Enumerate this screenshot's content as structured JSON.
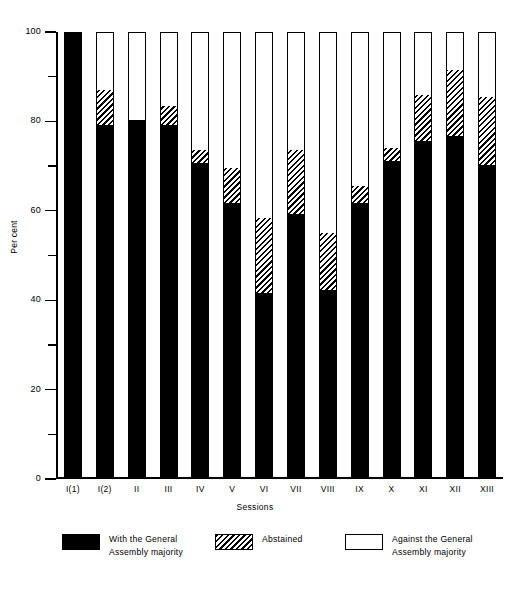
{
  "chart_data": {
    "type": "bar",
    "stacked": true,
    "title": "",
    "subtitle": "",
    "xlabel": "Sessions",
    "ylabel": "Per cent",
    "ylim": [
      0,
      100
    ],
    "grid": false,
    "legend_position": "bottom",
    "categories": [
      "I(1)",
      "I(2)",
      "II",
      "III",
      "IV",
      "V",
      "VI",
      "VII",
      "VIII",
      "IX",
      "X",
      "XI",
      "XII",
      "XIII"
    ],
    "y_ticks_major": [
      0,
      20,
      40,
      60,
      80,
      100
    ],
    "y_ticks_minor": [
      10,
      30,
      50,
      70,
      90
    ],
    "y_tick_labels": [
      "0",
      "20",
      "40",
      "60",
      "80",
      "100"
    ],
    "series": [
      {
        "name": "With the General Assembly majority",
        "key": "with",
        "fill": "solid-black",
        "color": "#000000",
        "values": [
          100,
          79,
          80,
          79,
          70.5,
          61.5,
          41.5,
          59,
          42,
          61.5,
          71,
          75.5,
          76.5,
          70
        ]
      },
      {
        "name": "Abstained",
        "key": "abstained",
        "fill": "diagonal-hatch",
        "color": "#ffffff",
        "values": [
          0,
          8,
          0,
          4.5,
          3,
          8,
          17,
          14.5,
          13,
          4,
          3,
          10.5,
          15,
          15.5
        ]
      },
      {
        "name": "Against the General Assembly majority",
        "key": "against",
        "fill": "white",
        "color": "#ffffff",
        "values": [
          0,
          13,
          20,
          16.5,
          26.5,
          30.5,
          41.5,
          26.5,
          45,
          34.5,
          26,
          14,
          8.5,
          14.5
        ]
      }
    ]
  },
  "axes": {
    "y_title": "Per cent",
    "x_title": "Sessions"
  },
  "legend": {
    "items": [
      {
        "label": "With the General\nAssembly majority",
        "swatch": "solid-black-swatch"
      },
      {
        "label": "Abstained",
        "swatch": "diagonal-hatch-swatch"
      },
      {
        "label": "Against the General\nAssembly majority",
        "swatch": "white-swatch"
      }
    ]
  }
}
